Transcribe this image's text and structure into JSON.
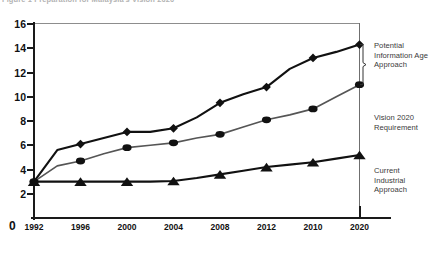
{
  "caption": "Figure 1   Preparation for Malaysia's Vision 2020",
  "axis": {
    "y_ticks": [
      16,
      14,
      12,
      10,
      8,
      6,
      4,
      2
    ],
    "y_zero_label": "0",
    "y_min": 0,
    "y_max": 16,
    "x_ticks": [
      "1992",
      "1996",
      "2000",
      "2004",
      "2008",
      "2012",
      "2010",
      "2020"
    ]
  },
  "annotations": [
    {
      "name": "potential-information-age-approach",
      "text": "Potential\nInformation Age\nApproach"
    },
    {
      "name": "vision-2020-requirement",
      "text": "Vision 2020\nRequirement"
    },
    {
      "name": "current-industrial-approach",
      "text": "Current\nIndustrial\nApproach"
    }
  ],
  "chart_data": {
    "type": "line",
    "title": "Figure 1   Preparation for Malaysia's Vision 2020",
    "xlabel": "",
    "ylabel": "",
    "ylim": [
      0,
      16
    ],
    "grid": false,
    "legend_position": "right-inline-annotations",
    "x": [
      1992,
      1994,
      1996,
      1998,
      2000,
      2002,
      2004,
      2006,
      2008,
      2010,
      2012,
      2014,
      2016,
      2018,
      2020
    ],
    "x_tick_labels": [
      "1992",
      "1996",
      "2000",
      "2004",
      "2008",
      "2012",
      "2010",
      "2020"
    ],
    "series": [
      {
        "name": "Potential Information Age Approach",
        "marker": "diamond",
        "color": "#111111",
        "values": [
          3.0,
          5.6,
          6.1,
          6.6,
          7.1,
          7.1,
          7.4,
          8.3,
          9.5,
          10.2,
          10.8,
          12.3,
          13.2,
          13.7,
          14.3
        ]
      },
      {
        "name": "Vision 2020 Requirement",
        "marker": "circle",
        "color": "#555555",
        "values": [
          3.0,
          4.3,
          4.7,
          5.3,
          5.8,
          6.0,
          6.2,
          6.6,
          6.9,
          7.5,
          8.1,
          8.5,
          9.0,
          10.0,
          11.0
        ]
      },
      {
        "name": "Current Industrial Approach",
        "marker": "triangle",
        "color": "#111111",
        "values": [
          3.0,
          3.0,
          3.0,
          3.0,
          3.0,
          3.0,
          3.05,
          3.3,
          3.6,
          3.9,
          4.2,
          4.4,
          4.6,
          4.9,
          5.2
        ]
      }
    ]
  }
}
